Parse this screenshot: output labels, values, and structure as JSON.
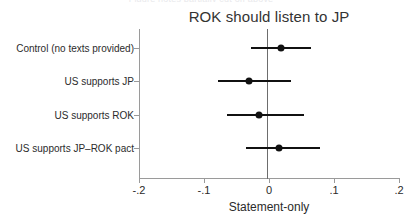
{
  "figure": {
    "clipped_caption": "Figure notes partially cut off above",
    "title": "ROK should listen to JP",
    "xaxis_title": "Statement-only"
  },
  "chart_data": {
    "type": "scatter",
    "title": "ROK should listen to JP",
    "xlabel": "Statement-only",
    "ylabel": "",
    "xlim": [
      -0.2,
      0.2
    ],
    "xticks": [
      -0.2,
      -0.1,
      0,
      0.1,
      0.2
    ],
    "xticklabels": [
      "-.2",
      "-.1",
      "0",
      ".1",
      ".2"
    ],
    "grid": false,
    "legend": null,
    "reference_line": 0,
    "orientation": "horizontal",
    "categories": [
      "Control (no texts provided)",
      "US supports JP",
      "US supports ROK",
      "US supports JP–ROK pact"
    ],
    "series": [
      {
        "name": "Statement-only",
        "points": [
          {
            "category": "Control (no texts provided)",
            "estimate": 0.018,
            "ci_low": -0.028,
            "ci_high": 0.065
          },
          {
            "category": "US supports JP",
            "estimate": -0.031,
            "ci_low": -0.078,
            "ci_high": 0.034
          },
          {
            "category": "US supports ROK",
            "estimate": -0.015,
            "ci_low": -0.065,
            "ci_high": 0.054
          },
          {
            "category": "US supports JP–ROK pact",
            "estimate": 0.016,
            "ci_low": -0.036,
            "ci_high": 0.078
          }
        ]
      }
    ]
  }
}
